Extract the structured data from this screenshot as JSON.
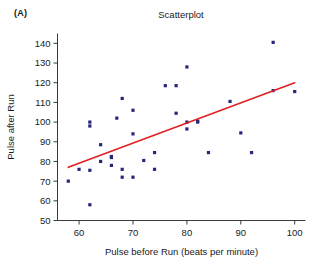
{
  "panel": {
    "label": "(A)"
  },
  "chart_data": {
    "type": "scatter",
    "title": "Scatterplot",
    "xlabel": "Pulse before Run (beats per minute)",
    "ylabel": "Pulse after Run",
    "xlim": [
      56,
      102
    ],
    "ylim": [
      50,
      145
    ],
    "xticks": [
      60,
      70,
      80,
      90,
      100
    ],
    "yticks": [
      50,
      60,
      70,
      80,
      90,
      100,
      110,
      120,
      130,
      140
    ],
    "grid": false,
    "legend": "none",
    "point_color": "#26267a",
    "line_color": "#e02020",
    "x": [
      58,
      60,
      62,
      62,
      62,
      62,
      64,
      64,
      66,
      66,
      66,
      67,
      68,
      68,
      68,
      70,
      70,
      70,
      72,
      74,
      74,
      76,
      78,
      78,
      80,
      80,
      80,
      82,
      82,
      84,
      88,
      90,
      92,
      96,
      96,
      100
    ],
    "y": [
      70,
      76,
      58,
      75.5,
      98,
      100,
      80,
      88.5,
      78,
      82,
      82.5,
      102,
      72,
      76,
      112,
      72,
      94,
      106,
      80.5,
      76,
      84.5,
      118.5,
      104.5,
      118.5,
      96.5,
      100,
      128,
      100,
      100.5,
      84.5,
      110.5,
      94.5,
      84.5,
      116,
      140.5,
      115.5
    ],
    "series": [
      {
        "name": "observations",
        "points": [
          [
            58,
            70
          ],
          [
            60,
            76
          ],
          [
            62,
            58
          ],
          [
            62,
            75.5
          ],
          [
            62,
            98
          ],
          [
            62,
            100
          ],
          [
            64,
            80
          ],
          [
            64,
            88.5
          ],
          [
            66,
            78
          ],
          [
            66,
            82
          ],
          [
            66,
            82.5
          ],
          [
            67,
            102
          ],
          [
            68,
            72
          ],
          [
            68,
            76
          ],
          [
            68,
            112
          ],
          [
            70,
            72
          ],
          [
            70,
            94
          ],
          [
            70,
            106
          ],
          [
            72,
            80.5
          ],
          [
            74,
            76
          ],
          [
            74,
            84.5
          ],
          [
            76,
            118.5
          ],
          [
            78,
            104.5
          ],
          [
            78,
            118.5
          ],
          [
            80,
            96.5
          ],
          [
            80,
            100
          ],
          [
            80,
            128
          ],
          [
            82,
            100
          ],
          [
            82,
            100.5
          ],
          [
            84,
            84.5
          ],
          [
            88,
            110.5
          ],
          [
            90,
            94.5
          ],
          [
            92,
            84.5
          ],
          [
            96,
            116
          ],
          [
            96,
            140.5
          ],
          [
            100,
            115.5
          ]
        ]
      }
    ],
    "trend_line": {
      "type": "linear-fit",
      "x0": 58,
      "y0": 77,
      "x1": 100,
      "y1": 120
    }
  }
}
